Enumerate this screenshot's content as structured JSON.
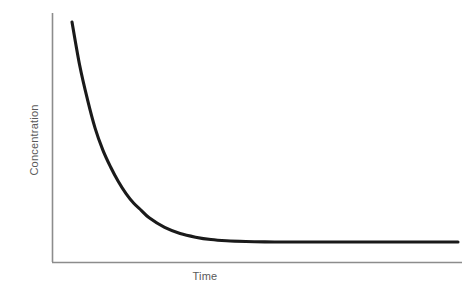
{
  "chart_data": {
    "type": "line",
    "title": "",
    "subtitle": "",
    "xlabel": "Time",
    "ylabel": "Concentration",
    "legend": [],
    "legend_position": "none",
    "grid": false,
    "xlim": [
      0,
      100
    ],
    "ylim": [
      0,
      100
    ],
    "xticks": [],
    "yticks": [],
    "xticklabels": [],
    "yticklabels": [],
    "annotations": [],
    "series": [
      {
        "name": "Concentration decay",
        "color": "#1a1a1a",
        "linewidth": 3,
        "x": [
          0,
          2,
          4,
          6,
          8,
          10,
          12,
          14,
          16,
          18,
          20,
          24,
          28,
          32,
          36,
          40,
          45,
          50,
          55,
          60,
          70,
          80,
          90,
          100
        ],
        "y": [
          100,
          82,
          68,
          56,
          47,
          40,
          34,
          29,
          25,
          22,
          19,
          15,
          12.5,
          11,
          10,
          9.5,
          9.2,
          9.05,
          9,
          9,
          9,
          9,
          9,
          9
        ]
      }
    ],
    "plateau_value": 9,
    "initial_value": 100,
    "axis_color": "#8c8c8c",
    "label_color": "#5a5a5a",
    "background_color": "#ffffff"
  },
  "axes": {
    "y_axis_name": "y-axis-line",
    "x_axis_name": "x-axis-line"
  }
}
